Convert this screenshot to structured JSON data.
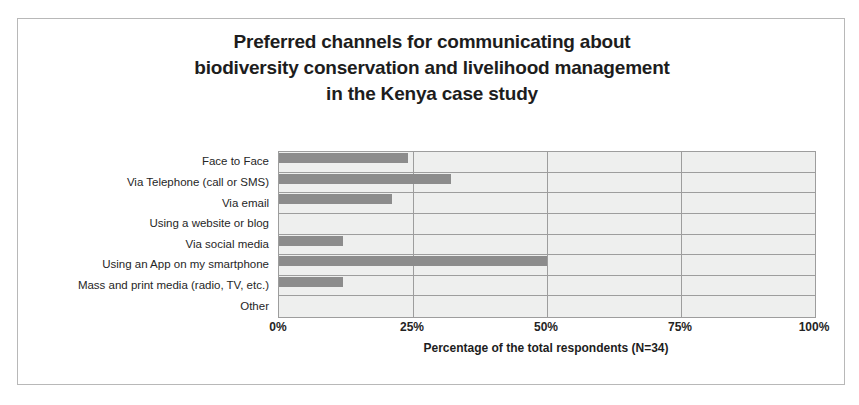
{
  "chart_data": {
    "type": "bar",
    "orientation": "horizontal",
    "title": "Preferred channels for communicating about biodiversity conservation and livelihood management in the Kenya case study",
    "title_lines": [
      "Preferred channels for communicating about",
      "biodiversity conservation and livelihood management",
      "in the Kenya case study"
    ],
    "categories": [
      "Face to Face",
      "Via Telephone (call or SMS)",
      "Via email",
      "Using a website or blog",
      "Via social media",
      "Using an App on my smartphone",
      "Mass and print media (radio, TV, etc.)",
      "Other"
    ],
    "values": [
      24,
      32,
      21,
      0,
      12,
      50,
      12,
      0
    ],
    "xlabel": "Percentage of the total respondents (N=34)",
    "ylabel": "",
    "xlim": [
      0,
      100
    ],
    "xticks": [
      0,
      25,
      50,
      75,
      100
    ],
    "xtick_labels": [
      "0%",
      "25%",
      "50%",
      "75%",
      "100%"
    ],
    "grid": true,
    "legend": false,
    "bar_color": "#8c8c8c",
    "plot_background": "#eeefee",
    "gridline_color": "#9d9d9d"
  }
}
